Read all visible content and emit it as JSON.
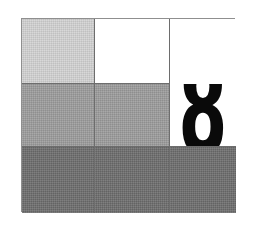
{
  "image": {
    "title": "Three-by-three tonal grid with numeral",
    "width": 256,
    "height": 225,
    "background_color": "#ffffff",
    "border_color": "#8f8f8f",
    "gridline_color": "#6d6d6d"
  },
  "palette": {
    "white": "#ffffff",
    "light_gray": "#d2d2d2",
    "medium_gray": "#9b9b9b",
    "dark_gray": "#6c6c6c",
    "glyph_black": "#0a0a0a"
  },
  "grid": {
    "columns": 3,
    "rows": 3,
    "cells": [
      {
        "id": "r1c1",
        "row": 1,
        "column": 1,
        "tone": "light_gray",
        "tone_class": "tone-light",
        "label": ""
      },
      {
        "id": "r1c2",
        "row": 1,
        "column": 2,
        "tone": "white",
        "tone_class": "tone-white",
        "label": ""
      },
      {
        "id": "r1c3",
        "row": 1,
        "column": 3,
        "tone": "white",
        "tone_class": "tone-white",
        "label": ""
      },
      {
        "id": "r2c1",
        "row": 2,
        "column": 1,
        "tone": "medium_gray",
        "tone_class": "tone-medium",
        "label": ""
      },
      {
        "id": "r2c2",
        "row": 2,
        "column": 2,
        "tone": "medium_gray",
        "tone_class": "tone-medium",
        "label": ""
      },
      {
        "id": "r2c3",
        "row": 2,
        "column": 3,
        "tone": "white",
        "tone_class": "tone-white",
        "label": ""
      },
      {
        "id": "r3c1",
        "row": 3,
        "column": 1,
        "tone": "dark_gray",
        "tone_class": "tone-dark",
        "label": ""
      },
      {
        "id": "r3c2",
        "row": 3,
        "column": 2,
        "tone": "dark_gray",
        "tone_class": "tone-dark",
        "label": ""
      },
      {
        "id": "r3c3",
        "row": 3,
        "column": 3,
        "tone": "dark_gray",
        "tone_class": "tone-dark",
        "label": ""
      }
    ]
  },
  "numeral": {
    "value": "8",
    "color": "#0a0a0a",
    "placement": "column-3, spanning rows 1-2"
  }
}
